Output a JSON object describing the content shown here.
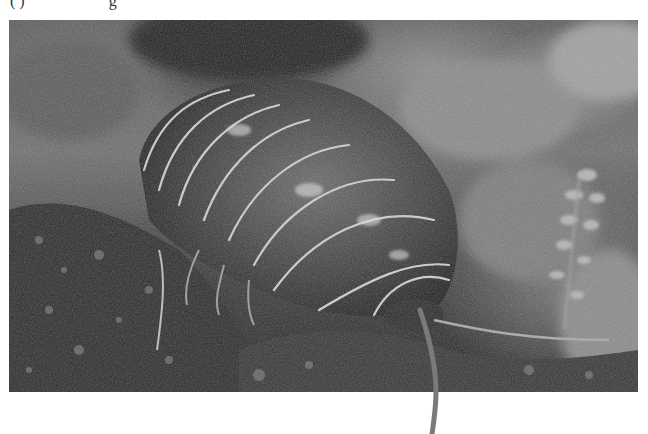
{
  "caption": {
    "visible_fragment": "( )                     g"
  },
  "image": {
    "subject": "pill bug (woodlouse) on moss",
    "color_mode": "grayscale",
    "segment_count": 9,
    "tones": {
      "shell": "#3c3c3c",
      "segment_edge": "#cfcfcf",
      "highlight": "#e6e6e6",
      "moss": "#2a2a2a",
      "background": "#6e6e6e"
    }
  }
}
